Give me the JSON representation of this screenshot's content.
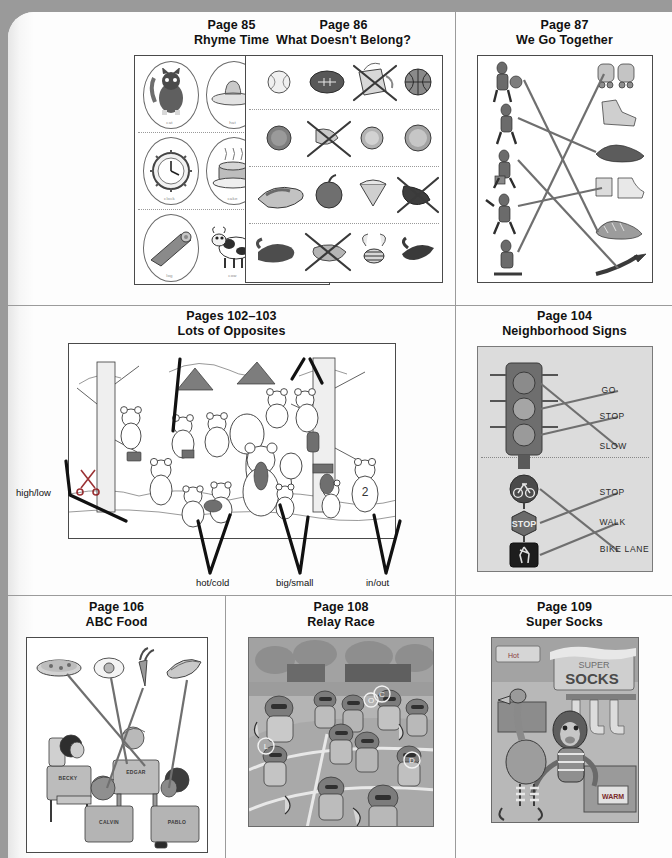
{
  "page": {
    "background_color": "#9a9a9a",
    "paper_color": "#fdfdfd"
  },
  "cells": [
    {
      "id": "page-85",
      "title_line1": "Page 85",
      "title_line2": "Rhyme Time",
      "type": "rhyme-grid",
      "items": [
        [
          "cat",
          "hat",
          "dog"
        ],
        [
          "clock",
          "cake",
          "snake"
        ],
        [
          "log",
          "cow",
          "frog"
        ]
      ]
    },
    {
      "id": "page-86",
      "title_line1": "Page 86",
      "title_line2": "What Doesn't Belong?",
      "type": "odd-one-out",
      "rows": [
        {
          "items": [
            "baseball",
            "football",
            "crossed-out-juice-box",
            "basketball"
          ],
          "crossed_index": 2
        },
        {
          "items": [
            "penny",
            "crossed-out-banana",
            "nickel",
            "quarter"
          ],
          "crossed_index": 1
        },
        {
          "items": [
            "hot-dog",
            "apple",
            "ice-cream-cone",
            "crossed-out-mitten"
          ],
          "crossed_index": 3
        },
        {
          "items": [
            "bird",
            "crossed-out-elephant",
            "bee",
            "bird-flying"
          ],
          "crossed_index": 1
        }
      ]
    },
    {
      "id": "page-87",
      "title_line1": "Page 87",
      "title_line2": "We Go Together",
      "type": "matching",
      "left_items": [
        "basketball-player",
        "football-player",
        "gardener",
        "hiker",
        "skier"
      ],
      "right_items": [
        "roller-skates",
        "work-boot",
        "dress-shoes",
        "rain-boots",
        "sneakers",
        "ski"
      ],
      "matches": [
        [
          0,
          4
        ],
        [
          1,
          2
        ],
        [
          2,
          5
        ],
        [
          3,
          1
        ],
        [
          4,
          0
        ]
      ]
    },
    {
      "id": "pages-102-103",
      "title_line1": "Pages 102–103",
      "title_line2": "Lots of Opposites",
      "type": "opposites-scene",
      "labels_top": [
        "closed/open",
        "happy/sad"
      ],
      "label_left": "high/low",
      "labels_bottom": [
        "hot/cold",
        "big/small",
        "in/out"
      ]
    },
    {
      "id": "page-104",
      "title_line1": "Page 104",
      "title_line2": "Neighborhood Signs",
      "type": "signs-matching",
      "group_one": {
        "sign": "traffic-light",
        "labels": [
          "GO",
          "STOP",
          "SLOW"
        ]
      },
      "group_two": {
        "signs": [
          "bike-route-sign",
          "stop-sign",
          "pedestrian-crossing-sign"
        ],
        "labels": [
          "STOP",
          "WALK",
          "BIKE LANE"
        ]
      }
    },
    {
      "id": "page-106",
      "title_line1": "Page 106",
      "title_line2": "ABC Food",
      "type": "classroom-scene",
      "foods": [
        "pizza",
        "egg",
        "carrot",
        "bananas"
      ],
      "student_names": [
        "BECKY",
        "EDGAR",
        "CALVIN",
        "PABLO"
      ]
    },
    {
      "id": "page-108",
      "title_line1": "Page 108",
      "title_line2": "Relay Race",
      "type": "hidden-letters-photo",
      "circled_letters": [
        "L",
        "C",
        "D",
        "O"
      ]
    },
    {
      "id": "page-109",
      "title_line1": "Page 109",
      "title_line2": "Super Socks",
      "type": "scene-photo",
      "sign_text_line1": "SUPER",
      "sign_text_line2": "SOCKS",
      "box_text": "WARM",
      "banner_text": "Hot"
    }
  ]
}
